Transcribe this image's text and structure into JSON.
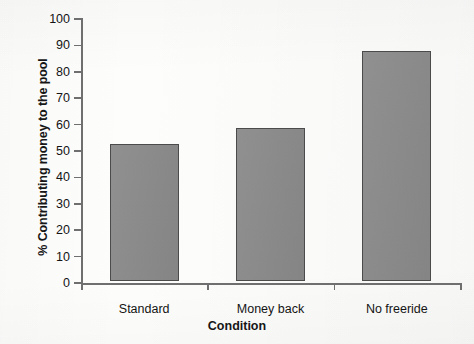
{
  "chart_data": {
    "type": "bar",
    "title": "",
    "xlabel": "Condition",
    "ylabel": "% Contributing money to the pool",
    "categories": [
      "Standard",
      "Money back",
      "No freeride"
    ],
    "values": [
      52,
      58,
      87
    ],
    "ylim": [
      0,
      100
    ],
    "ytick_labels": [
      "0",
      "10",
      "20",
      "30",
      "40",
      "50",
      "60",
      "70",
      "80",
      "90",
      "100"
    ],
    "ytick_values": [
      0,
      10,
      20,
      30,
      40,
      50,
      60,
      70,
      80,
      90,
      100
    ],
    "grid": false,
    "legend": null,
    "bar_color": "#8a8a8a",
    "bar_edge_color": "#4b4b4b",
    "axis_color": "#6f6f6f",
    "background_color": "#fdfdfc"
  }
}
